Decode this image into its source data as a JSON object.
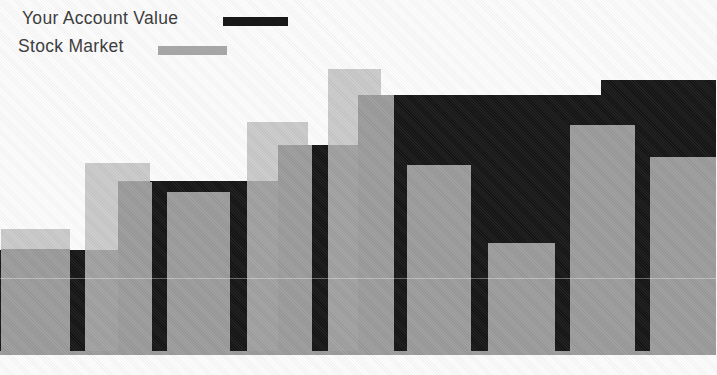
{
  "legend": {
    "items": [
      {
        "label": "Your Account Value",
        "swatch_color": "#181818",
        "swatch_name": "account-value-swatch"
      },
      {
        "label": "Stock Market",
        "swatch_color": "#a6a6a6",
        "swatch_name": "stock-market-swatch"
      }
    ]
  },
  "colors": {
    "account_black": "#161616",
    "market_gray": "#9c9c9c",
    "highlight_light_gray": "#cacaca",
    "background": "#fdfdfd",
    "legend_text": "#3d3d3d"
  },
  "chart_data": {
    "type": "bar",
    "title": "",
    "xlabel": "",
    "ylabel": "",
    "axes_visible": false,
    "gridlines": false,
    "legend_position": "top-left",
    "periods": 9,
    "note": "No axis ticks or labels are printed; values are estimated as percent of plot height (baseline = 0, tallest element ~ 99). Black account-value series renders as a continuous step silhouette behind the gray bars; gray bars 1, 2, 4, 5 carry lighter offset highlight caps where they exceed the black area.",
    "series": [
      {
        "name": "Your Account Value",
        "style": "step-area",
        "color": "#161616",
        "values_pct": [
          35.8,
          59.7,
          59.7,
          72.2,
          89.6,
          89.6,
          89.6,
          89.6,
          94.8
        ]
      },
      {
        "name": "Stock Market",
        "style": "bar",
        "color": "#9c9c9c",
        "values_pct": [
          36.1,
          59.4,
          55.9,
          72.2,
          89.6,
          65.3,
          38.2,
          79.2,
          68.1
        ]
      }
    ],
    "highlight_caps_pct": [
      43.1,
      66.0,
      null,
      80.2,
      98.6,
      null,
      null,
      null,
      null
    ]
  },
  "render": {
    "plot_bottom_black": 352,
    "plot_bottom_bars": 355,
    "black_segments": [
      {
        "x": 0,
        "w": 118,
        "top": 250
      },
      {
        "x": 118,
        "w": 160,
        "top": 181
      },
      {
        "x": 278,
        "w": 80,
        "top": 145
      },
      {
        "x": 358,
        "w": 243,
        "top": 95
      },
      {
        "x": 601,
        "w": 115,
        "top": 80
      }
    ],
    "light_caps": [
      {
        "x": 1,
        "w": 69,
        "top": 229
      },
      {
        "x": 85,
        "w": 65,
        "top": 163
      },
      {
        "x": 247,
        "w": 61,
        "top": 122
      },
      {
        "x": 328,
        "w": 53,
        "top": 69
      }
    ],
    "gray_bars": [
      {
        "x": 1,
        "w": 69,
        "top": 249
      },
      {
        "x": 118,
        "w": 34,
        "top": 182
      },
      {
        "x": 167,
        "w": 63,
        "top": 192
      },
      {
        "x": 278,
        "w": 34,
        "top": 145
      },
      {
        "x": 358,
        "w": 36,
        "top": 95
      },
      {
        "x": 407,
        "w": 64,
        "top": 165
      },
      {
        "x": 488,
        "w": 67,
        "top": 243
      },
      {
        "x": 570,
        "w": 65,
        "top": 125
      },
      {
        "x": 650,
        "w": 66,
        "top": 157
      }
    ]
  }
}
